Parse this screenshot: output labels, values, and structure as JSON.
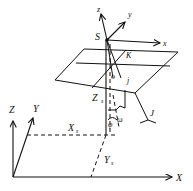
{
  "diagram": {
    "type": "coordinate-system-geometry",
    "world_axes": {
      "x": "X",
      "y": "Y",
      "z": "Z"
    },
    "local_axes": {
      "x": "x",
      "y": "y",
      "z": "z"
    },
    "points": {
      "sensor": "S",
      "origin": "o",
      "j": "j"
    },
    "angles": {
      "kappa": "K",
      "phi": "φ",
      "omega": "ω"
    },
    "offsets": {
      "xs_main": "X",
      "xs_sub": "s",
      "ys_main": "Y",
      "ys_sub": "s",
      "zs_main": "Z",
      "zs_sub": "s"
    },
    "curve_label": "J"
  }
}
